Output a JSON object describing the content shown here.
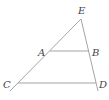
{
  "diagram": {
    "type": "geometry-triangle-with-parallel-segments",
    "points": {
      "E": {
        "label": "E",
        "x": 81,
        "y": 19,
        "label_x": 78,
        "label_y": 14
      },
      "A": {
        "label": "A",
        "x": 50,
        "y": 51,
        "label_x": 38,
        "label_y": 56
      },
      "B": {
        "label": "B",
        "x": 89,
        "y": 51,
        "label_x": 92,
        "label_y": 56
      },
      "C": {
        "label": "C",
        "x": 18,
        "y": 83,
        "label_x": 3,
        "label_y": 88
      },
      "D": {
        "label": "D",
        "x": 96,
        "y": 83,
        "label_x": 99,
        "label_y": 88
      }
    },
    "segments": [
      {
        "name": "line-CE",
        "x1": 10,
        "y1": 91,
        "x2": 81,
        "y2": 19
      },
      {
        "name": "line-ED",
        "x1": 81,
        "y1": 19,
        "x2": 98,
        "y2": 91
      },
      {
        "name": "segment-AB",
        "x1": 50,
        "y1": 51,
        "x2": 89,
        "y2": 51
      },
      {
        "name": "segment-CD",
        "x1": 18,
        "y1": 83,
        "x2": 96,
        "y2": 83
      }
    ],
    "line_color": "#9a9a9a",
    "label_color": "#444444"
  }
}
